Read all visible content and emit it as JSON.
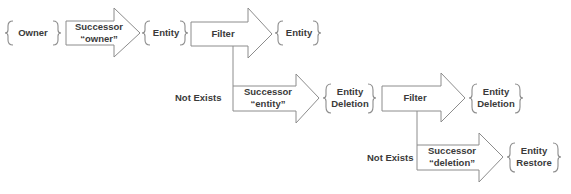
{
  "diagram": {
    "nodes": {
      "owner": {
        "label": "Owner"
      },
      "entity_1": {
        "label": "Entity"
      },
      "entity_2": {
        "label": "Entity"
      },
      "entity_deletion_1": {
        "line1": "Entity",
        "line2": "Deletion"
      },
      "entity_deletion_2": {
        "line1": "Entity",
        "line2": "Deletion"
      },
      "entity_restore": {
        "line1": "Entity",
        "line2": "Restore"
      }
    },
    "arrows": {
      "successor_owner": {
        "line1": "Successor",
        "line2": "“owner”"
      },
      "filter_1": {
        "label": "Filter"
      },
      "successor_entity": {
        "line1": "Successor",
        "line2": "“entity”"
      },
      "filter_2": {
        "label": "Filter"
      },
      "successor_deletion": {
        "line1": "Successor",
        "line2": "“deletion”"
      }
    },
    "branch_labels": {
      "not_exists_1": "Not Exists",
      "not_exists_2": "Not Exists"
    },
    "colors": {
      "stroke": "#8c8c8c",
      "text": "#3a3a3a",
      "fill": "#ffffff"
    }
  }
}
